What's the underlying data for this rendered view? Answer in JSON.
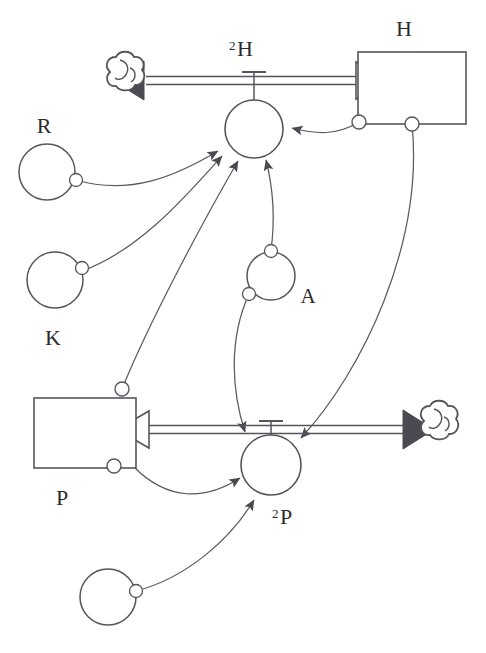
{
  "diagram": {
    "type": "system-dynamics-stock-and-flow",
    "background_color": "#ffffff",
    "line_color": "#55555c",
    "fill_color": "#4a4a52",
    "text_color": "#2b2b2b",
    "width": 486,
    "height": 653
  },
  "stocks": [
    {
      "id": "stock-h",
      "label": "H",
      "label_position": "above",
      "x": 358,
      "y": 52,
      "w": 108,
      "h": 72
    },
    {
      "id": "stock-p",
      "label": "P",
      "label_position": "below",
      "x": 34,
      "y": 398,
      "w": 102,
      "h": 70
    }
  ],
  "flows": [
    {
      "id": "flow-h",
      "valve_label": "²H",
      "valve_label_sup": "2",
      "valve_label_base": "H",
      "valve_cx": 254,
      "valve_cy": 129,
      "valve_r": 29,
      "pipe_y": 80,
      "pipe_x1": 134,
      "pipe_x2": 358,
      "left_end": "cloud",
      "left_arrow": "filled-left",
      "right_end": "stock-h",
      "right_arrow": "hollow-right"
    },
    {
      "id": "flow-p",
      "valve_label": "²P",
      "valve_label_sup": "2",
      "valve_label_base": "P",
      "valve_cx": 271,
      "valve_cy": 465,
      "valve_r": 30,
      "pipe_y": 429,
      "pipe_x1": 136,
      "pipe_x2": 404,
      "left_end": "stock-p",
      "left_arrow": "hollow-left",
      "right_end": "cloud",
      "right_arrow": "filled-right"
    }
  ],
  "clouds": [
    {
      "id": "cloud-left-top",
      "cx": 122,
      "cy": 81,
      "r": 16
    },
    {
      "id": "cloud-right-bottom",
      "cx": 436,
      "cy": 430,
      "r": 16
    }
  ],
  "variables": [
    {
      "id": "var-r",
      "label": "R",
      "label_position": "above",
      "cx": 47,
      "cy": 172,
      "r": 28
    },
    {
      "id": "var-k",
      "label": "K",
      "label_position": "below",
      "cx": 55,
      "cy": 280,
      "r": 28
    },
    {
      "id": "var-a",
      "label": "A",
      "label_position": "right",
      "cx": 271,
      "cy": 276,
      "r": 24
    },
    {
      "id": "var-unnamed",
      "label": "",
      "label_position": "none",
      "cx": 108,
      "cy": 597,
      "r": 28
    }
  ],
  "connectors": [
    {
      "id": "conn-r-to-h2",
      "from": "var-r",
      "to": "flow-h",
      "arrow": "filled"
    },
    {
      "id": "conn-k-to-h2",
      "from": "var-k",
      "to": "flow-h",
      "arrow": "filled"
    },
    {
      "id": "conn-p-to-h2",
      "from": "stock-p",
      "to": "flow-h",
      "arrow": "filled"
    },
    {
      "id": "conn-a-to-h2",
      "from": "var-a",
      "to": "flow-h",
      "arrow": "filled"
    },
    {
      "id": "conn-h-to-h2",
      "from": "stock-h",
      "to": "flow-h",
      "arrow": "filled"
    },
    {
      "id": "conn-a-to-p2",
      "from": "var-a",
      "to": "flow-p",
      "arrow": "filled"
    },
    {
      "id": "conn-h-to-p2",
      "from": "stock-h",
      "to": "flow-p",
      "arrow": "filled"
    },
    {
      "id": "conn-p-to-p2",
      "from": "stock-p",
      "to": "flow-p",
      "arrow": "filled"
    },
    {
      "id": "conn-unnamed-p2",
      "from": "var-unnamed",
      "to": "flow-p",
      "arrow": "filled"
    }
  ],
  "labels": {
    "h_stock": "H",
    "p_stock": "P",
    "r_var": "R",
    "k_var": "K",
    "a_var": "A",
    "h_rate_sup": "2",
    "h_rate_base": "H",
    "p_rate_sup": "2",
    "p_rate_base": "P"
  }
}
